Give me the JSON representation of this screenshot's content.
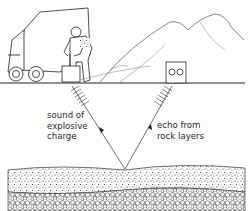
{
  "figure": {
    "labels": {
      "sound": "sound of\nexplosive\ncharge",
      "echo": "echo from\nrock layers"
    },
    "elements": {
      "truck": "survey-truck",
      "worker": "worker-with-detonator",
      "detonator": "plunger-box",
      "mountains": "mountain-range",
      "geophone": "geophone-recorder-box",
      "ground": "ground-surface",
      "rock_layers": [
        "fine-sediment-layer",
        "coarse-gravel-layer"
      ]
    },
    "colors": {
      "ink": "#2a2a2a",
      "background": "#ffffff"
    }
  }
}
